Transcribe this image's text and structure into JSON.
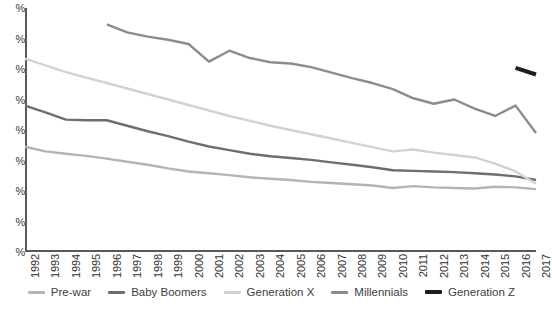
{
  "chart_data": {
    "type": "line",
    "title": "",
    "xlabel": "",
    "ylabel": "",
    "grid": false,
    "legend_position": "bottom",
    "x": [
      1992,
      1993,
      1994,
      1995,
      1996,
      1997,
      1998,
      1999,
      2000,
      2001,
      2002,
      2003,
      2004,
      2005,
      2006,
      2007,
      2008,
      2009,
      2010,
      2011,
      2012,
      2013,
      2014,
      2015,
      2016,
      2017
    ],
    "y_tick_labels": [
      "%",
      "%",
      "%",
      "%",
      "%",
      "%",
      "%",
      "%",
      "%"
    ],
    "y_tick_values": [
      80,
      70,
      60,
      50,
      40,
      30,
      20,
      10,
      0
    ],
    "ylim": [
      0,
      80
    ],
    "xlim": [
      1992,
      2017
    ],
    "series": [
      {
        "name": "Pre-war",
        "color": "#b4b4b4",
        "x": [
          1992,
          1993,
          1994,
          1995,
          1996,
          1997,
          1998,
          1999,
          2000,
          2001,
          2002,
          2003,
          2004,
          2005,
          2006,
          2007,
          2008,
          2009,
          2010,
          2011,
          2012,
          2013,
          2014,
          2015,
          2016,
          2017
        ],
        "values": [
          34.5,
          33.0,
          32.2,
          31.5,
          30.6,
          29.6,
          28.6,
          27.4,
          26.4,
          25.8,
          25.2,
          24.5,
          24.0,
          23.6,
          23.0,
          22.6,
          22.2,
          21.8,
          21.0,
          21.6,
          21.2,
          21.0,
          20.8,
          21.4,
          21.2,
          20.6
        ]
      },
      {
        "name": "Baby Boomers",
        "color": "#6e6e6e",
        "x": [
          1992,
          1993,
          1994,
          1995,
          1996,
          1997,
          1998,
          1999,
          2000,
          2001,
          2002,
          2003,
          2004,
          2005,
          2006,
          2007,
          2008,
          2009,
          2010,
          2011,
          2012,
          2013,
          2014,
          2015,
          2016,
          2017
        ],
        "values": [
          48.0,
          45.8,
          43.4,
          43.2,
          43.2,
          41.4,
          39.6,
          38.0,
          36.2,
          34.6,
          33.4,
          32.2,
          31.4,
          30.8,
          30.2,
          29.4,
          28.6,
          27.8,
          26.8,
          26.6,
          26.4,
          26.2,
          25.8,
          25.4,
          24.8,
          23.6
        ]
      },
      {
        "name": "Generation X",
        "color": "#d2d2d2",
        "x": [
          1992,
          1993,
          1994,
          1995,
          1996,
          1997,
          1998,
          1999,
          2000,
          2001,
          2002,
          2003,
          2004,
          2005,
          2006,
          2007,
          2008,
          2009,
          2010,
          2011,
          2012,
          2013,
          2014,
          2015,
          2016,
          2017
        ],
        "values": [
          63.4,
          61.2,
          59.0,
          57.2,
          55.4,
          53.6,
          51.8,
          50.0,
          48.2,
          46.4,
          44.6,
          43.0,
          41.4,
          40.0,
          38.6,
          37.2,
          35.8,
          34.4,
          33.0,
          33.6,
          32.6,
          31.8,
          31.0,
          29.0,
          26.4,
          22.4
        ]
      },
      {
        "name": "Millennials",
        "color": "#8c8c8c",
        "x": [
          1996,
          1997,
          1998,
          1999,
          2000,
          2001,
          2002,
          2003,
          2004,
          2005,
          2006,
          2007,
          2008,
          2009,
          2010,
          2011,
          2012,
          2013,
          2014,
          2015,
          2016,
          2017
        ],
        "values": [
          74.6,
          72.0,
          70.6,
          69.6,
          68.2,
          62.4,
          66.0,
          63.6,
          62.2,
          61.8,
          60.6,
          58.8,
          57.0,
          55.4,
          53.4,
          50.4,
          48.6,
          50.0,
          47.0,
          44.6,
          48.0,
          39.0
        ]
      },
      {
        "name": "Generation Z",
        "color": "#1e1e1e",
        "x": [
          2016,
          2017
        ],
        "values": [
          60.4,
          58.2
        ]
      }
    ]
  },
  "legend": {
    "items": [
      {
        "label": "Pre-war"
      },
      {
        "label": "Baby Boomers"
      },
      {
        "label": "Generation X"
      },
      {
        "label": "Millennials"
      },
      {
        "label": "Generation Z"
      }
    ]
  }
}
